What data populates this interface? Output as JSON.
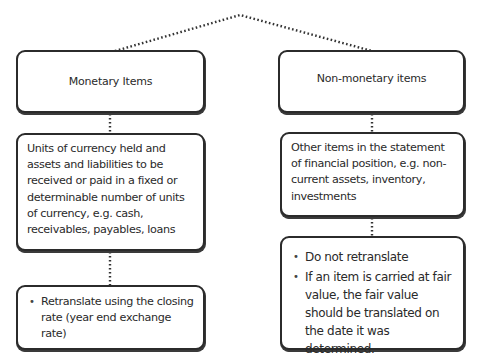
{
  "diagram": {
    "left": {
      "title": "Monetary Items",
      "definition": "Units of currency held and assets and liabilities to be received or paid in a fixed or determinable number of units of currency, e.g. cash, receivables, payables, loans",
      "treatment": [
        "Retranslate using the closing rate (year end exchange rate)"
      ]
    },
    "right": {
      "title": "Non-monetary items",
      "definition": "Other items in the statement of financial position, e.g. non-current assets, inventory, investments",
      "treatment": [
        "Do not retranslate",
        "If an item is carried at fair value, the fair value should be translated on the date it was determined."
      ]
    },
    "colors": {
      "border": "#2b2b2b",
      "text": "#2a2a2a",
      "connector": "#333333"
    }
  }
}
